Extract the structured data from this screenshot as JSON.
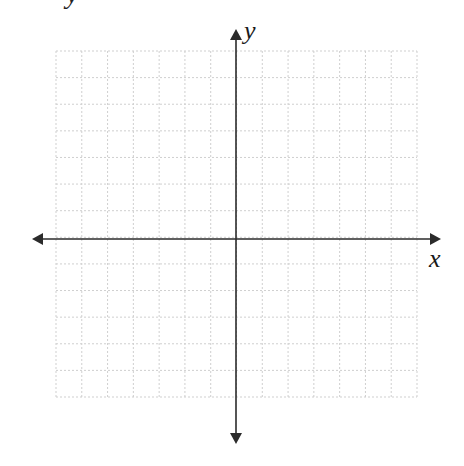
{
  "header": {
    "clipped_text": "y"
  },
  "graph": {
    "type": "coordinate-plane",
    "grid": {
      "columns": 14,
      "rows": 13,
      "left": 56,
      "top": 51,
      "right": 417,
      "bottom": 397,
      "line_color": "#cfcfcf",
      "line_style": "dashed"
    },
    "origin": {
      "x": 236,
      "y": 239
    },
    "axes": {
      "color": "#2b2b2b",
      "x_axis": {
        "label": "x",
        "from": 32,
        "to": 441
      },
      "y_axis": {
        "label": "y",
        "from": 29,
        "to": 444
      }
    }
  }
}
